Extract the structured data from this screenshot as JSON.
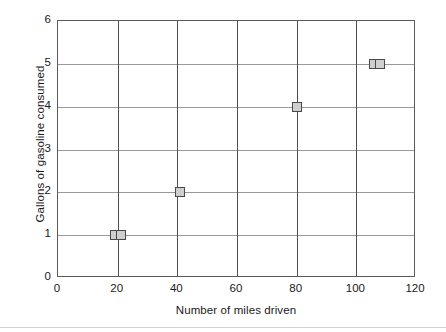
{
  "chart_data": {
    "type": "scatter",
    "title": "",
    "xlabel": "Number of miles driven",
    "ylabel": "Gallons of gasoline consumed",
    "xlim": [
      0,
      120
    ],
    "ylim": [
      0,
      6
    ],
    "xticks": [
      0,
      20,
      40,
      60,
      80,
      100,
      120
    ],
    "yticks": [
      0,
      1,
      2,
      3,
      4,
      5,
      6
    ],
    "xtick_labels": [
      "0",
      "20",
      "40",
      "60",
      "80",
      "100",
      "120"
    ],
    "ytick_labels": [
      "0",
      "1",
      "2",
      "3",
      "4",
      "5",
      "6"
    ],
    "grid": true,
    "grid_axes": "both",
    "legend": false,
    "legend_position": "none",
    "marker_shape": "square",
    "marker_fill": "#cfcfcf",
    "marker_edge": "#4a4a4a",
    "points": [
      {
        "x": 19,
        "y": 1
      },
      {
        "x": 21,
        "y": 1
      },
      {
        "x": 41,
        "y": 2
      },
      {
        "x": 80,
        "y": 4
      },
      {
        "x": 106,
        "y": 5
      },
      {
        "x": 108,
        "y": 5
      }
    ]
  },
  "colors": {
    "background": "#ffffff",
    "axis_frame": "#5a5a5a",
    "gridline_horizontal": "#9a9a9a",
    "gridline_vertical": "#4f4f4f",
    "text": "#1a1a1a",
    "bottom_rule": "#d3d3d3"
  }
}
